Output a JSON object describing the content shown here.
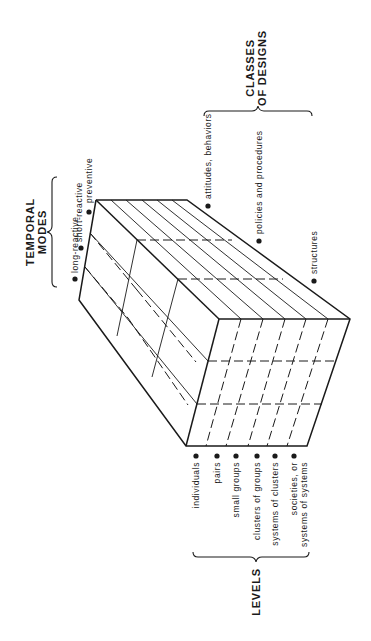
{
  "diagram": {
    "type": "3d-cube-taxonomy",
    "colors": {
      "ink": "#1a1a1a",
      "background": "#ffffff"
    },
    "temporal_modes": {
      "title_line1": "TEMPORAL",
      "title_line2": "MODES",
      "items": [
        {
          "label": "long-reactive"
        },
        {
          "label": "short-reactive"
        },
        {
          "label": "preventive"
        }
      ]
    },
    "classes_of_designs": {
      "title_line1": "CLASSES",
      "title_line2": "OF DESIGNS",
      "items": [
        {
          "label": "attitudes, behaviors"
        },
        {
          "label": "policies and procedures"
        },
        {
          "label": "structures"
        }
      ]
    },
    "levels": {
      "title": "LEVELS",
      "items": [
        {
          "label": "individuals"
        },
        {
          "label": "pairs"
        },
        {
          "label": "small groups"
        },
        {
          "label": "clusters of groups"
        },
        {
          "label": "systems of clusters"
        },
        {
          "label_line1": "societies, or",
          "label_line2": "systems of systems"
        }
      ]
    }
  }
}
